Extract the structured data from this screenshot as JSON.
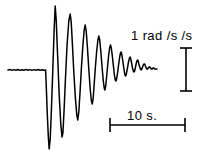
{
  "figure": {
    "background_color": "#ffffff",
    "ink_color": "#000000",
    "width": 214,
    "height": 159
  },
  "vertical_scale": {
    "label": "1 rad /s /s",
    "value": 1,
    "unit": "rad /s /s",
    "icon": "i-beam-vertical-icon",
    "x": 186,
    "y_top": 48,
    "y_bottom": 91,
    "cap_half_width": 6
  },
  "horizontal_scale": {
    "label": "10 s.",
    "value": 10,
    "unit": "s.",
    "icon": "i-beam-horizontal-icon",
    "y": 125,
    "x_left": 110,
    "x_right": 185,
    "cap_half_height": 7
  },
  "chart_data": {
    "type": "line",
    "title": "",
    "xlabel": "",
    "ylabel": "",
    "grid": false,
    "legend": null,
    "baseline_y": 70,
    "xlim": [
      0,
      214
    ],
    "ylim": [
      159,
      0
    ],
    "series": [
      {
        "name": "angular-acceleration-trace",
        "color": "#000000",
        "points": [
          [
            8,
            70
          ],
          [
            10,
            69.5
          ],
          [
            12,
            70.4
          ],
          [
            14,
            69.6
          ],
          [
            16,
            70.3
          ],
          [
            18,
            69.5
          ],
          [
            20,
            70.4
          ],
          [
            22,
            69.7
          ],
          [
            24,
            70.2
          ],
          [
            26,
            69.4
          ],
          [
            28,
            70.3
          ],
          [
            30,
            69.6
          ],
          [
            32,
            70.4
          ],
          [
            34,
            69.6
          ],
          [
            36,
            70.2
          ],
          [
            38,
            69.5
          ],
          [
            40,
            70.3
          ],
          [
            42,
            69.8
          ],
          [
            44,
            70.2
          ],
          [
            45.6,
            70
          ],
          [
            46.2,
            84
          ],
          [
            47.2,
            112
          ],
          [
            48.4,
            138
          ],
          [
            49.2,
            149
          ],
          [
            50.2,
            139
          ],
          [
            51.4,
            110
          ],
          [
            52.8,
            70
          ],
          [
            54.2,
            28
          ],
          [
            55.2,
            6
          ],
          [
            56.2,
            20
          ],
          [
            57.6,
            55
          ],
          [
            59.2,
            95
          ],
          [
            60.8,
            124
          ],
          [
            62.0,
            137
          ],
          [
            62.9,
            133
          ],
          [
            64.0,
            112
          ],
          [
            65.4,
            80
          ],
          [
            67.0,
            46
          ],
          [
            68.8,
            21
          ],
          [
            70.2,
            14
          ],
          [
            71.2,
            22
          ],
          [
            72.4,
            44
          ],
          [
            73.8,
            72
          ],
          [
            75.4,
            98
          ],
          [
            76.8,
            115
          ],
          [
            77.8,
            120
          ],
          [
            78.8,
            112
          ],
          [
            80.0,
            93
          ],
          [
            81.4,
            68
          ],
          [
            82.9,
            45
          ],
          [
            84.2,
            30
          ],
          [
            85.2,
            25
          ],
          [
            86.2,
            31
          ],
          [
            87.4,
            47
          ],
          [
            88.8,
            69
          ],
          [
            90.2,
            89
          ],
          [
            91.4,
            101
          ],
          [
            92.3,
            104
          ],
          [
            93.2,
            98
          ],
          [
            94.2,
            84
          ],
          [
            95.4,
            67
          ],
          [
            96.7,
            51
          ],
          [
            97.9,
            40
          ],
          [
            98.8,
            36
          ],
          [
            99.7,
            40
          ],
          [
            100.8,
            51
          ],
          [
            102.0,
            66
          ],
          [
            103.2,
            80
          ],
          [
            104.2,
            88
          ],
          [
            104.9,
            90
          ],
          [
            105.7,
            86
          ],
          [
            106.6,
            77
          ],
          [
            107.7,
            65
          ],
          [
            108.8,
            54
          ],
          [
            109.8,
            47
          ],
          [
            110.5,
            45
          ],
          [
            111.3,
            48
          ],
          [
            112.2,
            55
          ],
          [
            113.3,
            65
          ],
          [
            114.4,
            75
          ],
          [
            115.3,
            80
          ],
          [
            116.0,
            81
          ],
          [
            116.8,
            78
          ],
          [
            117.7,
            72
          ],
          [
            118.7,
            64
          ],
          [
            119.7,
            57
          ],
          [
            120.5,
            53
          ],
          [
            121.2,
            52
          ],
          [
            121.9,
            55
          ],
          [
            122.8,
            61
          ],
          [
            123.8,
            68
          ],
          [
            124.7,
            74
          ],
          [
            125.4,
            76
          ],
          [
            126.1,
            75
          ],
          [
            126.9,
            71
          ],
          [
            127.8,
            66
          ],
          [
            128.7,
            61
          ],
          [
            129.5,
            58
          ],
          [
            130.1,
            57
          ],
          [
            130.8,
            59
          ],
          [
            131.6,
            63
          ],
          [
            132.5,
            68
          ],
          [
            133.3,
            71
          ],
          [
            134.0,
            72
          ],
          [
            134.6,
            71
          ],
          [
            135.3,
            68
          ],
          [
            136.1,
            64
          ],
          [
            136.9,
            61
          ],
          [
            137.6,
            60
          ],
          [
            138.2,
            61
          ],
          [
            138.9,
            64
          ],
          [
            139.7,
            67
          ],
          [
            140.5,
            69
          ],
          [
            141.2,
            70
          ],
          [
            141.8,
            69
          ],
          [
            142.5,
            67
          ],
          [
            143.3,
            65
          ],
          [
            144.0,
            64
          ],
          [
            144.7,
            64
          ],
          [
            145.4,
            66
          ],
          [
            146.2,
            68
          ],
          [
            146.9,
            69
          ],
          [
            147.6,
            69
          ],
          [
            148.3,
            68
          ],
          [
            149.0,
            67
          ],
          [
            149.8,
            67
          ],
          [
            150.6,
            68
          ],
          [
            151.4,
            69
          ],
          [
            152.2,
            69
          ],
          [
            153.0,
            68
          ],
          [
            153.9,
            68
          ],
          [
            154.8,
            69
          ],
          [
            155.8,
            69
          ],
          [
            157.0,
            69
          ]
        ]
      }
    ]
  }
}
